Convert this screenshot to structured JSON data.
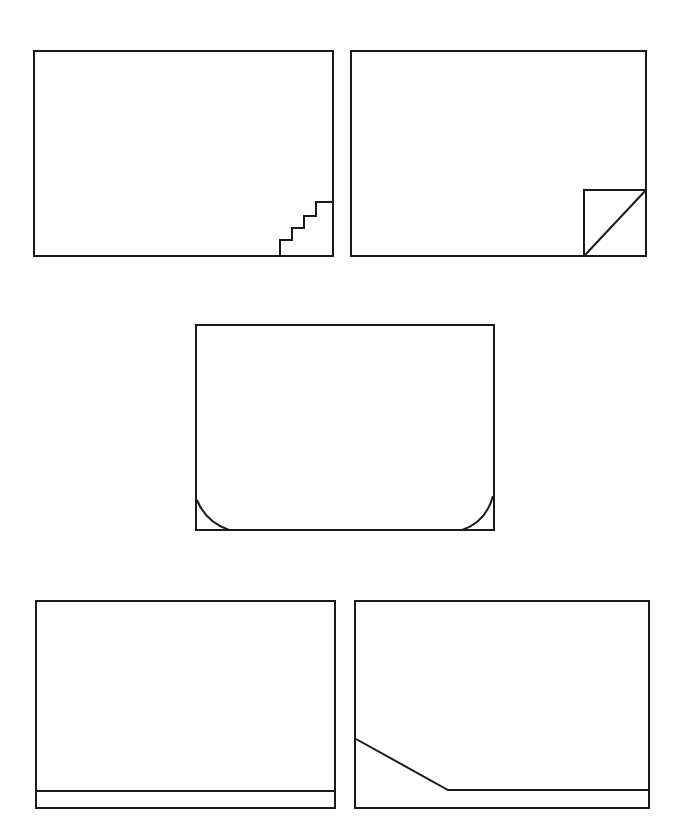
{
  "canvas": {
    "width": 685,
    "height": 839,
    "background": "#ffffff",
    "stroke": "#1a1a1a"
  },
  "panels": [
    {
      "id": "stepped-corner",
      "frame": {
        "x": 34,
        "y": 51,
        "w": 299,
        "h": 205
      },
      "detail": {
        "type": "staircase",
        "points": "280,256 280,240 292,240 292,228 304,228 304,216 316,216 316,202 333,202"
      }
    },
    {
      "id": "diagonal-corner",
      "frame": {
        "x": 351,
        "y": 51,
        "w": 295,
        "h": 205
      },
      "detail": {
        "type": "square-with-diagonal",
        "square": {
          "x": 584,
          "y": 190,
          "w": 62,
          "h": 66
        },
        "diagonal": "585,255 646,190"
      }
    },
    {
      "id": "rounded-bottom-corners",
      "frame": {
        "x": 196,
        "y": 325,
        "w": 298,
        "h": 205
      },
      "detail": {
        "type": "arc-corners",
        "left_arc": "M197,500 Q206,522 229,530",
        "right_arc": "M462,530 Q486,522 493,496"
      }
    },
    {
      "id": "base-strip",
      "frame": {
        "x": 36,
        "y": 601,
        "w": 299,
        "h": 207
      },
      "detail": {
        "type": "horizontal-line",
        "line": "36,791 335,791"
      }
    },
    {
      "id": "sloped-base",
      "frame": {
        "x": 355,
        "y": 601,
        "w": 294,
        "h": 207
      },
      "detail": {
        "type": "polyline",
        "points": "356,739 448,790 649,790"
      }
    }
  ]
}
